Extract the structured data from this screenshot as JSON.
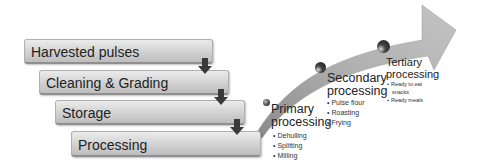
{
  "diagram": {
    "steps": [
      {
        "label": "Harvested pulses"
      },
      {
        "label": "Cleaning & Grading"
      },
      {
        "label": "Storage"
      },
      {
        "label": "Processing"
      }
    ],
    "stages": [
      {
        "title_line1": "Primary",
        "title_line2": "processing",
        "items": [
          "Dehulling",
          "Splitting",
          "Milling"
        ]
      },
      {
        "title_line1": "Secondary",
        "title_line2": "processing",
        "items": [
          "Pulse flour",
          "Roasting",
          "Frying"
        ]
      },
      {
        "title_line1": "Tertiary",
        "title_line2": "processing",
        "items": [
          "Ready to eat",
          "snacks",
          "Ready meals"
        ]
      }
    ],
    "colors": {
      "box_top": "#ececec",
      "box_bottom": "#bdbdbd",
      "arrow_fill": "#b3b3b3",
      "down_arrow": "#3a3a3a",
      "sphere": "#2a2a2a"
    }
  }
}
